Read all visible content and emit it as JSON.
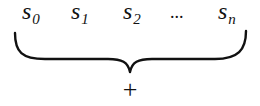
{
  "diagram": {
    "terms": [
      {
        "base": "s",
        "sub": "0"
      },
      {
        "base": "s",
        "sub": "1"
      },
      {
        "base": "s",
        "sub": "2"
      },
      {
        "ellipsis": "..."
      },
      {
        "base": "s",
        "sub": "n"
      }
    ],
    "brace": {
      "orientation": "under",
      "color": "#111111"
    },
    "operator": "+"
  }
}
